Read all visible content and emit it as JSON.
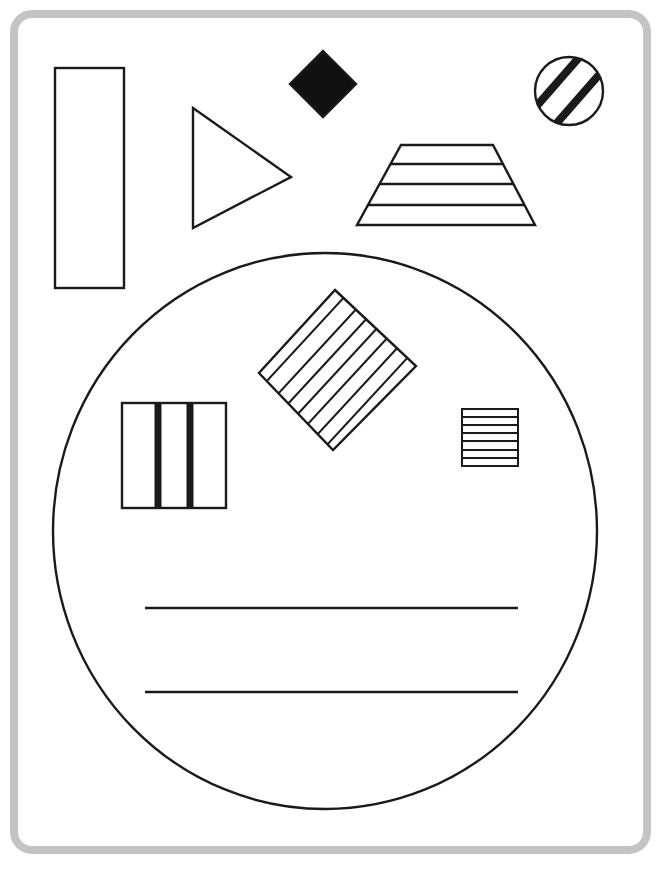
{
  "canvas": {
    "width": 669,
    "height": 872,
    "background": "#ffffff"
  },
  "frame": {
    "border_color": "#c4c4c4",
    "stroke_color": "#1a1a1a"
  },
  "shapes": [
    {
      "id": "tall-rectangle",
      "type": "rectangle",
      "fill": "none",
      "pattern": "none"
    },
    {
      "id": "triangle",
      "type": "triangle",
      "fill": "none",
      "pattern": "none"
    },
    {
      "id": "diamond",
      "type": "diamond",
      "fill": "#111111",
      "pattern": "solid"
    },
    {
      "id": "striped-circle",
      "type": "circle",
      "fill": "none",
      "pattern": "2 diagonal thick stripes"
    },
    {
      "id": "trapezoid",
      "type": "trapezoid",
      "fill": "none",
      "pattern": "3 horizontal lines"
    },
    {
      "id": "large-circle",
      "type": "circle",
      "fill": "none",
      "pattern": "none"
    },
    {
      "id": "rotated-square",
      "type": "square-rotated",
      "fill": "none",
      "pattern": "7 parallel diagonal lines"
    },
    {
      "id": "vertical-striped-square",
      "type": "square",
      "fill": "none",
      "pattern": "2 thick vertical stripes"
    },
    {
      "id": "horizontal-striped-square",
      "type": "square",
      "fill": "none",
      "pattern": "6 horizontal lines"
    },
    {
      "id": "writing-lines",
      "type": "lines",
      "count": 2
    }
  ]
}
